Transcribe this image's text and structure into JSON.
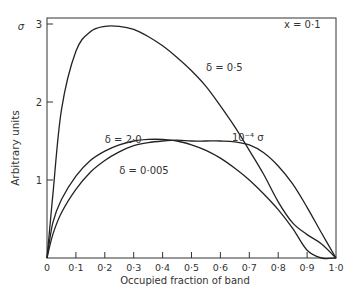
{
  "chart_data": {
    "type": "line",
    "title": "",
    "xlabel": "Occupied fraction of band",
    "ylabel": "Arbitrary units",
    "ylabel_symbol": "σ",
    "xlim": [
      0,
      1.0
    ],
    "ylim": [
      0,
      3.1
    ],
    "grid": false,
    "x_ticks": [
      "0",
      "0·1",
      "0·2",
      "0·3",
      "0·4",
      "0·5",
      "0·6",
      "0·7",
      "0·8",
      "0·9",
      "1·0"
    ],
    "y_ticks": [
      "1",
      "2",
      "3"
    ],
    "annotations": [
      {
        "text": "x = 0·1",
        "x": 0.82,
        "y": 2.95
      },
      {
        "text": "δ = 0·5",
        "x": 0.55,
        "y": 2.4
      },
      {
        "text": "δ = 2·0",
        "x": 0.2,
        "y": 1.47
      },
      {
        "text": "δ = 0·005",
        "x": 0.25,
        "y": 1.08
      },
      {
        "text": "10⁻⁴ σ",
        "x": 0.64,
        "y": 1.5
      }
    ],
    "x": [
      0,
      0.02,
      0.05,
      0.1,
      0.15,
      0.2,
      0.25,
      0.3,
      0.35,
      0.4,
      0.45,
      0.5,
      0.55,
      0.6,
      0.65,
      0.7,
      0.75,
      0.8,
      0.85,
      0.9,
      0.95,
      1.0
    ],
    "series": [
      {
        "name": "δ = 0·5",
        "values": [
          0,
          0.8,
          1.9,
          2.65,
          2.9,
          2.97,
          2.97,
          2.93,
          2.84,
          2.72,
          2.57,
          2.4,
          2.2,
          1.95,
          1.68,
          1.38,
          1.07,
          0.72,
          0.45,
          0.3,
          0.18,
          0
        ]
      },
      {
        "name": "δ = 2·0",
        "values": [
          0,
          0.45,
          0.75,
          1.05,
          1.25,
          1.37,
          1.45,
          1.5,
          1.52,
          1.52,
          1.5,
          1.45,
          1.38,
          1.28,
          1.15,
          1.0,
          0.82,
          0.62,
          0.38,
          0.1,
          0,
          0
        ]
      },
      {
        "name": "δ = 0·005",
        "values": [
          0,
          0.3,
          0.58,
          0.88,
          1.1,
          1.25,
          1.36,
          1.44,
          1.48,
          1.5,
          1.51,
          1.5,
          1.5,
          1.5,
          1.49,
          1.45,
          1.35,
          1.18,
          0.95,
          0.65,
          0.32,
          0
        ]
      }
    ]
  }
}
